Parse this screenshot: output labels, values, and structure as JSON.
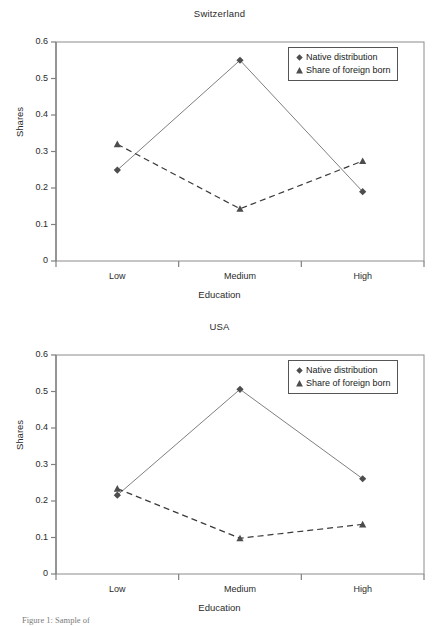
{
  "figure": {
    "caption": "Figure 1: Sample of"
  },
  "common": {
    "xlabel": "Education",
    "ylabel": "Shares",
    "categories": [
      "Low",
      "Medium",
      "High"
    ],
    "yticks": [
      "0",
      "0.1",
      "0.2",
      "0.3",
      "0.4",
      "0.5",
      "0.6"
    ],
    "legend": [
      {
        "label": "Native distribution",
        "marker": "diamond-marker-icon"
      },
      {
        "label": "Share of foreign born",
        "marker": "triangle-marker-icon"
      }
    ],
    "colors": {
      "native_line": "#7f7f7f",
      "foreign_line": "#3a3a3a",
      "marker": "#4d4d4d",
      "axis": "#808080",
      "frame": "#8c8c8c"
    }
  },
  "charts": [
    {
      "id": "switzerland",
      "chart_data": {
        "type": "line",
        "title": "Switzerland",
        "xlabel": "Education",
        "ylabel": "Shares",
        "categories": [
          "Low",
          "Medium",
          "High"
        ],
        "ylim": [
          0,
          0.6
        ],
        "yticks": [
          0,
          0.1,
          0.2,
          0.3,
          0.4,
          0.5,
          0.6
        ],
        "grid": false,
        "legend_position": "top-right",
        "series": [
          {
            "name": "Native distribution",
            "values": [
              0.249,
              0.55,
              0.19
            ],
            "marker": "diamond",
            "linestyle": "solid"
          },
          {
            "name": "Share of foreign born",
            "values": [
              0.32,
              0.143,
              0.274
            ],
            "marker": "triangle",
            "linestyle": "dashed"
          }
        ]
      }
    },
    {
      "id": "usa",
      "chart_data": {
        "type": "line",
        "title": "USA",
        "xlabel": "Education",
        "ylabel": "Shares",
        "categories": [
          "Low",
          "Medium",
          "High"
        ],
        "ylim": [
          0,
          0.6
        ],
        "yticks": [
          0,
          0.1,
          0.2,
          0.3,
          0.4,
          0.5,
          0.6
        ],
        "grid": false,
        "legend_position": "top-right",
        "series": [
          {
            "name": "Native distribution",
            "values": [
              0.216,
              0.506,
              0.261
            ],
            "marker": "diamond",
            "linestyle": "solid"
          },
          {
            "name": "Share of foreign born",
            "values": [
              0.234,
              0.098,
              0.136
            ],
            "marker": "triangle",
            "linestyle": "dashed"
          }
        ]
      }
    }
  ]
}
